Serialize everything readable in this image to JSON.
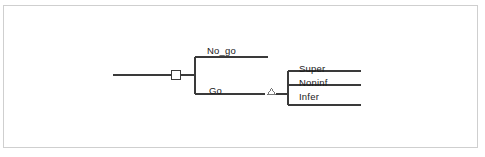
{
  "diagram": {
    "frame": {
      "border_color": "#cfcfcf",
      "background": "#ffffff"
    },
    "line_color": "#3a3a3a",
    "text_color": "#1a1a1a",
    "root": {
      "node_type": "decision-square",
      "label": ""
    },
    "branches": [
      {
        "id": "no-go",
        "label": "No_go",
        "terminal": true
      },
      {
        "id": "go",
        "label": "Go",
        "terminal": false,
        "node_type": "chance-triangle"
      }
    ],
    "outcomes": [
      {
        "id": "super",
        "label": "Super"
      },
      {
        "id": "noninf",
        "label": "Noninf"
      },
      {
        "id": "infer",
        "label": "Infer"
      }
    ]
  }
}
